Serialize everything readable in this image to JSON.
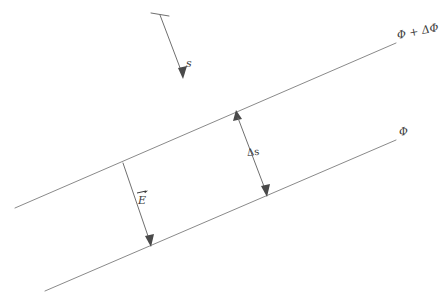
{
  "figure": {
    "background_color": "#ffffff",
    "line_color": "#8a8a8a",
    "label_color": "#3a3a3a",
    "width": 446,
    "height": 304
  },
  "labels": {
    "upper_equipotential": "Φ + ΔΦ",
    "lower_equipotential": "Φ",
    "displacement": "s",
    "separation": "Δs",
    "field_vector": "E"
  },
  "geometry": {
    "upper_line": {
      "x1": 15,
      "y1": 208,
      "x2": 396,
      "y2": 43
    },
    "lower_line": {
      "x1": 45,
      "y1": 291,
      "x2": 396,
      "y2": 140
    },
    "s_arrow": {
      "x1": 160,
      "y1": 15,
      "x2": 183,
      "y2": 77
    },
    "s_tick": {
      "x1": 151,
      "y1": 13,
      "x2": 169,
      "y2": 16
    },
    "delta_s_arrow": {
      "x1": 237,
      "y1": 113,
      "x2": 266,
      "y2": 194
    },
    "e_arrow": {
      "x1": 123,
      "y1": 163,
      "x2": 150,
      "y2": 244
    }
  }
}
